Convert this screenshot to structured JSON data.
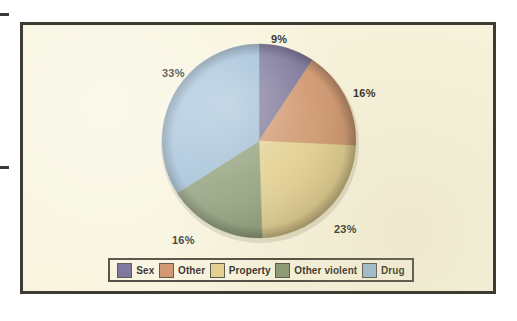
{
  "figure": {
    "panel_bg": "#f8f4dd",
    "border_color": "#3e3b33"
  },
  "chart_data": {
    "type": "pie",
    "title": "",
    "subtitle": "",
    "xlabel": "",
    "ylabel": "",
    "legend_position": "bottom",
    "grid": false,
    "start_angle_deg": 0,
    "direction": "clockwise",
    "categories": [
      "Sex",
      "Other",
      "Property",
      "Other violent",
      "Drug"
    ],
    "values": [
      9,
      16,
      23,
      16,
      33
    ],
    "value_labels": [
      "9%",
      "16%",
      "23%",
      "16%",
      "33%"
    ],
    "colors": [
      "#6b6490",
      "#cc8a5f",
      "#e3cd85",
      "#7e9268",
      "#92b6d4"
    ],
    "slices": [
      {
        "label": "Sex",
        "value": 9,
        "display": "9%",
        "color": "#6b6490"
      },
      {
        "label": "Other",
        "value": 16,
        "display": "16%",
        "color": "#cc8a5f"
      },
      {
        "label": "Property",
        "value": 23,
        "display": "23%",
        "color": "#e3cd85"
      },
      {
        "label": "Other violent",
        "value": 16,
        "display": "16%",
        "color": "#7e9268"
      },
      {
        "label": "Drug",
        "value": 33,
        "display": "33%",
        "color": "#92b6d4"
      }
    ]
  },
  "labels": {
    "top": "9%",
    "right": "16%",
    "lower_right": "23%",
    "lower_left": "16%",
    "left": "33%"
  },
  "legend": {
    "items": [
      {
        "label": "Sex",
        "color": "#6b6490"
      },
      {
        "label": "Other",
        "color": "#cc8a5f"
      },
      {
        "label": "Property",
        "color": "#e3cd85"
      },
      {
        "label": "Other violent",
        "color": "#7e9268"
      },
      {
        "label": "Drug",
        "color": "#92b6d4"
      }
    ]
  }
}
